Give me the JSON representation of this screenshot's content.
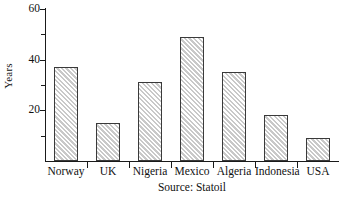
{
  "chart_data": {
    "type": "bar",
    "title": "",
    "subtitle": "",
    "xlabel": "",
    "ylabel": "Years",
    "categories": [
      "Norway",
      "UK",
      "Nigeria",
      "Mexico",
      "Algeria",
      "Indonesia",
      "USA"
    ],
    "values": [
      37,
      15,
      31,
      49,
      35,
      18,
      9
    ],
    "ylim": [
      0,
      60
    ],
    "y_major_ticks": [
      20,
      40,
      60
    ],
    "y_major_tick_labels": [
      "20",
      "40",
      "60"
    ],
    "y_minor_ticks": [
      10,
      30,
      50
    ],
    "grid": false,
    "legend": false,
    "legend_position": "none",
    "annotations": [
      "Source: Statoil"
    ],
    "bar_fill": "#ffffff",
    "bar_hatch": "diagonal-forward-slash",
    "bar_hatch_color": "#c9c9c9",
    "bar_edge_color": "#3a3a3a",
    "axis_color": "#1a1a1a",
    "background": "#ffffff"
  },
  "caption": {
    "source_text": "Source: Statoil"
  }
}
